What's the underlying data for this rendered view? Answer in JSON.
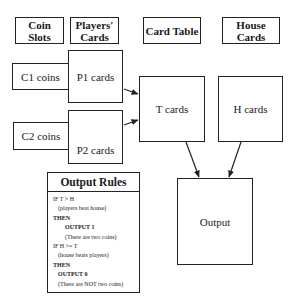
{
  "headers": {
    "coin_slots": "Coin Slots",
    "players_cards": "Players' Cards",
    "card_table": "Card Table",
    "house_cards": "House Cards"
  },
  "nodes": {
    "c1": "C1 coins",
    "p1": "P1 cards",
    "c2": "C2 coins",
    "p2": "P2 cards",
    "t": "T cards",
    "h": "H cards",
    "output": "Output"
  },
  "edges": [
    {
      "from": "P1 cards",
      "to": "T cards"
    },
    {
      "from": "P2 cards",
      "to": "T cards"
    },
    {
      "from": "T cards",
      "to": "Output"
    },
    {
      "from": "H cards",
      "to": "Output"
    }
  ],
  "rules": {
    "title": "Output Rules",
    "lines": [
      "IF T > H",
      "(players beat house)",
      "THEN",
      "OUTPUT 1",
      "(There are two coins)",
      "IF H >= T",
      "(house beats players)",
      "THEN",
      "OUTPUT 0",
      "(There are NOT two coins)"
    ]
  }
}
